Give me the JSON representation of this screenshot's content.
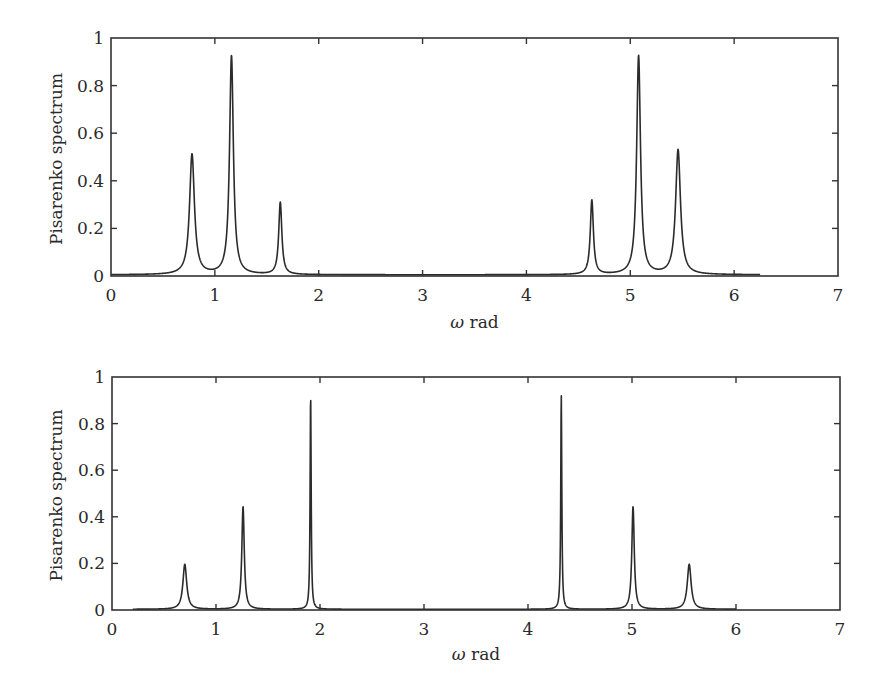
{
  "chart_data": [
    {
      "type": "line",
      "title": "",
      "xlabel": "ω rad",
      "ylabel": "Pisarenko spectrum",
      "xlim": [
        0,
        7
      ],
      "ylim": [
        0,
        1
      ],
      "xticks": [
        "0",
        "1",
        "2",
        "3",
        "4",
        "5",
        "6",
        "7"
      ],
      "yticks": [
        "0",
        "0.2",
        "0.4",
        "0.6",
        "0.8",
        "1"
      ],
      "grid": false,
      "legend": null,
      "x_range_of_curve": [
        0,
        6.25
      ],
      "peaks": [
        {
          "x": 0.78,
          "y": 0.55,
          "width": 0.028
        },
        {
          "x": 1.16,
          "y": 1.0,
          "width": 0.022
        },
        {
          "x": 1.63,
          "y": 0.33,
          "width": 0.018
        },
        {
          "x": 4.63,
          "y": 0.34,
          "width": 0.018
        },
        {
          "x": 5.08,
          "y": 1.0,
          "width": 0.022
        },
        {
          "x": 5.46,
          "y": 0.57,
          "width": 0.028
        }
      ],
      "baseline": 0.005,
      "series": [
        {
          "name": "Pisarenko spectrum",
          "peaks_x": [
            0.78,
            1.16,
            1.63,
            4.63,
            5.08,
            5.46
          ],
          "peaks_y": [
            0.55,
            1.0,
            0.33,
            0.34,
            1.0,
            0.57
          ]
        }
      ]
    },
    {
      "type": "line",
      "title": "",
      "xlabel": "ω rad",
      "ylabel": "Pisarenko spectrum",
      "xlim": [
        0,
        7
      ],
      "ylim": [
        0,
        1
      ],
      "xticks": [
        "0",
        "1",
        "2",
        "3",
        "4",
        "5",
        "6",
        "7"
      ],
      "yticks": [
        "0",
        "0.2",
        "0.4",
        "0.6",
        "0.8",
        "1"
      ],
      "grid": false,
      "legend": null,
      "x_range_of_curve": [
        0.2,
        6.0
      ],
      "peaks": [
        {
          "x": 0.7,
          "y": 0.21,
          "width": 0.022
        },
        {
          "x": 1.26,
          "y": 0.48,
          "width": 0.014
        },
        {
          "x": 1.91,
          "y": 1.0,
          "width": 0.006
        },
        {
          "x": 4.32,
          "y": 1.0,
          "width": 0.006
        },
        {
          "x": 5.01,
          "y": 0.48,
          "width": 0.014
        },
        {
          "x": 5.55,
          "y": 0.21,
          "width": 0.022
        }
      ],
      "baseline": 0.003,
      "series": [
        {
          "name": "Pisarenko spectrum",
          "peaks_x": [
            0.7,
            1.26,
            1.91,
            4.32,
            5.01,
            5.55
          ],
          "peaks_y": [
            0.21,
            0.48,
            1.0,
            1.0,
            0.48,
            0.21
          ]
        }
      ]
    }
  ],
  "layout": {
    "plots": [
      {
        "left": 111,
        "right": 838,
        "top": 38,
        "bottom": 276,
        "xlabel_y": 304,
        "ylabel_x": 62
      },
      {
        "left": 112,
        "right": 840,
        "top": 377,
        "bottom": 610,
        "xlabel_y": 642,
        "ylabel_x": 62
      }
    ]
  }
}
